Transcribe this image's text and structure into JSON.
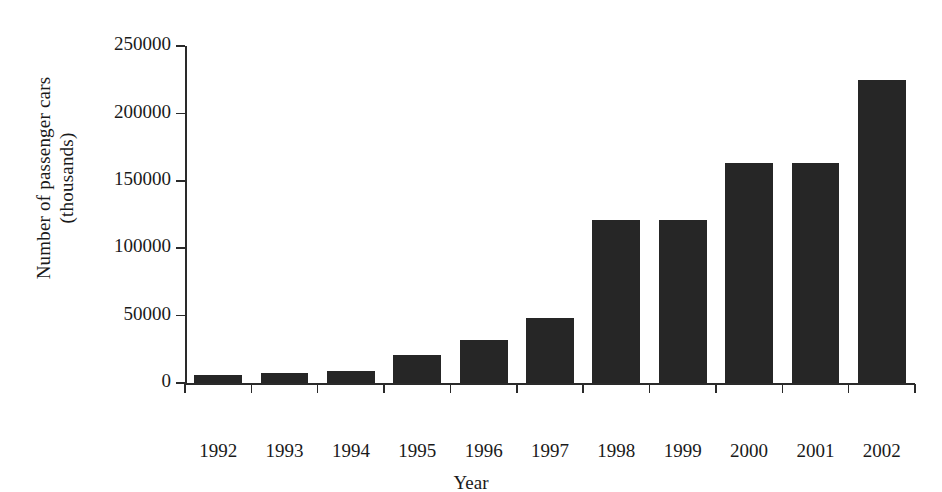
{
  "chart_data": {
    "type": "bar",
    "title": "",
    "xlabel": "Year",
    "ylabel": "Number of passenger cars (thousands)",
    "ylabel_lines": [
      "Number of passenger cars",
      "(thousands)"
    ],
    "categories": [
      "1992",
      "1993",
      "1994",
      "1995",
      "1996",
      "1997",
      "1998",
      "1999",
      "2000",
      "2001",
      "2002"
    ],
    "values": [
      6000,
      7500,
      9000,
      21000,
      32000,
      48500,
      121000,
      121000,
      163000,
      163000,
      225000
    ],
    "ylim": [
      0,
      250000
    ],
    "ytick_labels": [
      "0",
      "50000",
      "100000",
      "150000",
      "200000",
      "250000"
    ],
    "ytick_values": [
      0,
      50000,
      100000,
      150000,
      200000,
      250000
    ],
    "grid": false,
    "legend": null,
    "bar_color": "#262626",
    "axis_color": "#2a2a2a",
    "background_color": "#ffffff"
  }
}
